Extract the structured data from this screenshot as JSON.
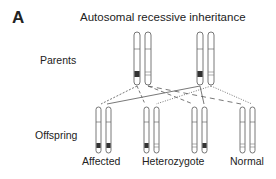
{
  "figure": {
    "panel_letter": "A",
    "title": "Autosomal recessive inheritance",
    "row_labels": {
      "parents": "Parents",
      "offspring": "Offspring"
    },
    "parents": [
      {
        "chromosomes": [
          "mutant",
          "normal"
        ]
      },
      {
        "chromosomes": [
          "mutant",
          "normal"
        ]
      }
    ],
    "offspring": [
      {
        "label": "Affected",
        "chromosomes": [
          "mutant",
          "mutant"
        ]
      },
      {
        "label": "Heterozygote",
        "chromosomes": [
          "mutant",
          "normal"
        ]
      },
      {
        "label": "",
        "chromosomes": [
          "normal",
          "mutant"
        ]
      },
      {
        "label": "Normal",
        "chromosomes": [
          "normal",
          "normal"
        ]
      }
    ],
    "offspring_labels": {
      "affected": "Affected",
      "heterozygote": "Heterozygote",
      "normal": "Normal"
    },
    "colors": {
      "line": "#444444",
      "mutant_band": "#333333",
      "outline": "#555555"
    }
  }
}
